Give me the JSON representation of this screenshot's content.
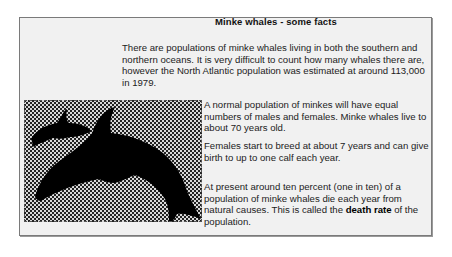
{
  "title": "Minke whales - some facts",
  "paragraphs": {
    "intro": "There are populations of minke whales living in both the southern and northern oceans. It is very difficult to count how many whales there are, however the North Atlantic population was estimated at around 113,000 in 1979.",
    "sex_ratio": "A normal population of minkes will have equal numbers of males and females. Minke whales live to about 70 years old.",
    "breeding": "Females start to breed at about 7 years and can give birth to up to one calf each year.",
    "death_rate_before": "At present around ten percent (one in ten) of a population of minke whales die each year from natural causes. This is called the ",
    "death_rate_term": "death rate",
    "death_rate_after": " of the population."
  },
  "figure": {
    "icon": "whale-silhouette-icon"
  }
}
